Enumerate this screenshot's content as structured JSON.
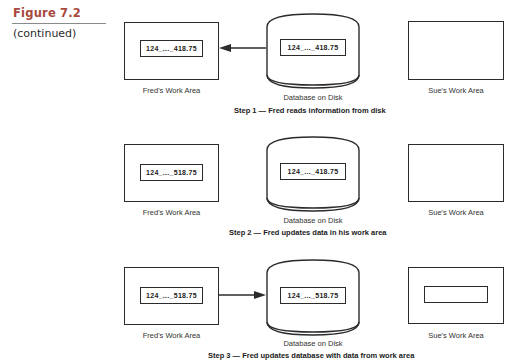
{
  "figure": {
    "title": "Figure 7.2",
    "subtitle": "(continued)",
    "accent_color": "#a8483c"
  },
  "labels": {
    "fred": "Fred's Work Area",
    "database": "Database on Disk",
    "sue": "Sue's Work Area"
  },
  "steps": [
    {
      "caption": "Step 1 — Fred reads information from disk",
      "fred_value": "124_..._418.75",
      "db_value": "124_..._418.75",
      "sue_value": "",
      "arrow": "database-to-fred"
    },
    {
      "caption": "Step 2 — Fred updates data in his work area",
      "fred_value": "124_..._518.75",
      "db_value": "124_..._418.75",
      "sue_value": "",
      "arrow": "none"
    },
    {
      "caption": "Step 3 — Fred updates database with data from work area",
      "fred_value": "124_..._518.75",
      "db_value": "124_..._518.75",
      "sue_value": "",
      "arrow": "fred-to-database"
    }
  ]
}
